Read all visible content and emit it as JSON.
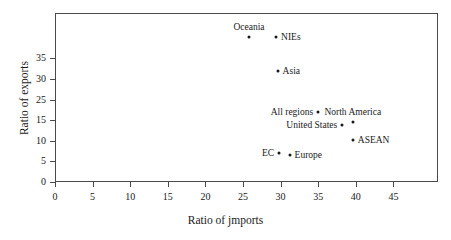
{
  "chart_data": {
    "type": "scatter",
    "title": "",
    "xlabel": "Ratio of jmports",
    "ylabel": "Ratio of exports",
    "xlim": [
      0,
      51
    ],
    "ylim": [
      0,
      38
    ],
    "grid": false,
    "legend": "none",
    "xticks": [
      {
        "value": 0,
        "label": "0"
      },
      {
        "value": 5,
        "label": "5"
      },
      {
        "value": 10,
        "label": "10"
      },
      {
        "value": 15,
        "label": "15"
      },
      {
        "value": 20,
        "label": "20"
      },
      {
        "value": 25,
        "label": "25"
      },
      {
        "value": 30,
        "label": "30"
      },
      {
        "value": 35,
        "label": "35"
      },
      {
        "value": 40,
        "label": "40"
      },
      {
        "value": 45,
        "label": "45"
      }
    ],
    "yticks": [
      {
        "value": 0,
        "label": "0"
      },
      {
        "value": 5,
        "label": "5"
      },
      {
        "value": 10,
        "label": "10"
      },
      {
        "value": 15,
        "label": "15"
      },
      {
        "value": 20,
        "label": "25"
      },
      {
        "value": 25,
        "label": "30"
      },
      {
        "value": 30,
        "label": "35"
      }
    ],
    "points": [
      {
        "name": "Oceania",
        "x": 25.8,
        "y": 35.3,
        "label": "Oceania",
        "label_pos": "above"
      },
      {
        "name": "NIEs",
        "x": 29.4,
        "y": 35.3,
        "label": "NIEs",
        "label_pos": "right"
      },
      {
        "name": "Asia",
        "x": 29.6,
        "y": 27.0,
        "label": "Asia",
        "label_pos": "right"
      },
      {
        "name": "All regions",
        "x": 35.0,
        "y": 17.0,
        "label": "All regions",
        "label_pos": "left"
      },
      {
        "name": "North America",
        "x": 39.6,
        "y": 14.5,
        "label": "North America",
        "label_pos": "above"
      },
      {
        "name": "United States",
        "x": 38.2,
        "y": 13.8,
        "label": "United States",
        "label_pos": "left"
      },
      {
        "name": "ASEAN",
        "x": 39.6,
        "y": 10.2,
        "label": "ASEAN",
        "label_pos": "right"
      },
      {
        "name": "EC",
        "x": 29.8,
        "y": 7.1,
        "label": "EC",
        "label_pos": "left"
      },
      {
        "name": "Europe",
        "x": 31.2,
        "y": 6.6,
        "label": "Europe",
        "label_pos": "right"
      }
    ]
  }
}
